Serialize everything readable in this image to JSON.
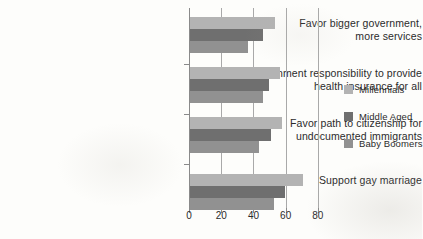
{
  "chart_data": {
    "type": "bar",
    "orientation": "horizontal",
    "title": "",
    "subtitle": "",
    "xlabel": "",
    "ylabel": "",
    "xlim": [
      0,
      90
    ],
    "xticks": [
      0,
      20,
      40,
      60,
      80
    ],
    "xtick_labels": [
      "0",
      "20",
      "40",
      "60",
      "80"
    ],
    "grid": true,
    "grid_axis": "x",
    "legend_position": "right",
    "categories": [
      "Favor bigger government, more services",
      "Government responsibility to provide health insurance for all",
      "Favor path to citizenship for undocumented immigrants",
      "Support gay marriage"
    ],
    "category_lines": [
      [
        "Favor bigger government,",
        "more services"
      ],
      [
        "Government responsibility to provide",
        "health insurance for all"
      ],
      [
        "Favor path to citizenship for",
        "undocumented immigrants"
      ],
      [
        "Support gay marriage"
      ]
    ],
    "series": [
      {
        "name": "Millennials",
        "color": "#b3b3b3",
        "values": [
          53,
          56,
          57,
          70
        ]
      },
      {
        "name": "Middle Aged",
        "color": "#6f6f6f",
        "values": [
          45,
          49,
          50,
          59
        ]
      },
      {
        "name": "Baby Boomers",
        "color": "#919191",
        "values": [
          36,
          45,
          43,
          52
        ]
      }
    ]
  },
  "legend": {
    "items": [
      {
        "label": "Millennials",
        "color": "#b3b3b3"
      },
      {
        "label": "Middle Aged",
        "color": "#6f6f6f"
      },
      {
        "label": "Baby Boomers",
        "color": "#919191"
      }
    ]
  },
  "axis": {
    "tick_labels": [
      "0",
      "20",
      "40",
      "60",
      "80"
    ]
  },
  "colors": {
    "millennials": "#b3b3b3",
    "middle_aged": "#6f6f6f",
    "baby_boomers": "#919191",
    "gridline": "#a9a9a9",
    "text": "#2b2b2b",
    "background": "#fdfdfb"
  }
}
